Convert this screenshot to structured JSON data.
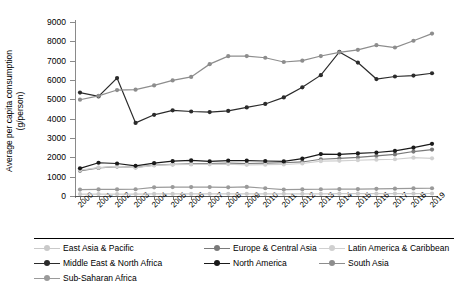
{
  "chart_data": {
    "type": "line",
    "title": "",
    "xlabel": "",
    "ylabel": "Average per capita consumption (g/person)",
    "ylabel_line1": "Average per capita consumption",
    "ylabel_line2": "(g/person)",
    "ylim": [
      0,
      9000
    ],
    "ystep": 1000,
    "yticks": [
      0,
      1000,
      2000,
      3000,
      4000,
      5000,
      6000,
      7000,
      8000,
      9000
    ],
    "grid": false,
    "legend_position": "bottom",
    "categories": [
      "2000",
      "2001",
      "2002",
      "2003",
      "2004",
      "2005",
      "2006",
      "2007",
      "2008",
      "2009",
      "2010",
      "2011",
      "2012",
      "2013",
      "2014",
      "2015",
      "2016",
      "2017",
      "2018",
      "2019"
    ],
    "series": [
      {
        "name": "East Asia & Pacific",
        "color": "#c9c9c9",
        "marker": "circle",
        "values": [
          100,
          100,
          100,
          100,
          105,
          105,
          105,
          110,
          110,
          110,
          110,
          115,
          115,
          115,
          120,
          120,
          120,
          125,
          125,
          130
        ]
      },
      {
        "name": "Europe & Central Asia",
        "color": "#7a7a7a",
        "marker": "circle",
        "values": [
          1300,
          1450,
          1520,
          1480,
          1600,
          1640,
          1660,
          1680,
          1700,
          1680,
          1700,
          1720,
          1760,
          1900,
          1950,
          2000,
          2080,
          2150,
          2300,
          2400
        ]
      },
      {
        "name": "Latin America & Caribbean",
        "color": "#d0d0d0",
        "marker": "circle",
        "values": [
          1340,
          1470,
          1530,
          1470,
          1580,
          1620,
          1630,
          1640,
          1650,
          1610,
          1620,
          1630,
          1680,
          1800,
          1820,
          1850,
          1880,
          1900,
          1980,
          1950
        ]
      },
      {
        "name": "Middle East & North Africa",
        "color": "#2b2b2b",
        "marker": "circle",
        "values": [
          5350,
          5150,
          6100,
          3780,
          4200,
          4430,
          4370,
          4340,
          4400,
          4580,
          4760,
          5100,
          5620,
          6250,
          7450,
          6900,
          6050,
          6180,
          6230,
          6350
        ]
      },
      {
        "name": "North America",
        "color": "#1a1a1a",
        "marker": "circle",
        "values": [
          1430,
          1720,
          1680,
          1560,
          1700,
          1800,
          1840,
          1790,
          1830,
          1830,
          1810,
          1790,
          1930,
          2170,
          2150,
          2200,
          2250,
          2330,
          2500,
          2700
        ]
      },
      {
        "name": "South Asia",
        "color": "#8d8d8d",
        "marker": "circle",
        "values": [
          4980,
          5180,
          5480,
          5500,
          5720,
          5980,
          6160,
          6820,
          7230,
          7240,
          7150,
          6930,
          7000,
          7240,
          7430,
          7560,
          7800,
          7680,
          8030,
          8400
        ]
      },
      {
        "name": "Sub-Saharan Africa",
        "color": "#9a9a9a",
        "marker": "circle",
        "values": [
          330,
          340,
          340,
          350,
          450,
          460,
          460,
          460,
          450,
          470,
          400,
          330,
          340,
          350,
          360,
          360,
          370,
          380,
          390,
          400
        ]
      }
    ],
    "legend_rows": [
      [
        {
          "label": "East Asia & Pacific",
          "color": "#c9c9c9",
          "x": 0
        },
        {
          "label": "Europe & Central Asia",
          "color": "#7a7a7a",
          "x": 170
        },
        {
          "label": "Latin America & Caribbean",
          "color": "#d0d0d0",
          "x": 285
        }
      ],
      [
        {
          "label": "Middle East & North Africa",
          "color": "#2b2b2b",
          "x": 0
        },
        {
          "label": "North America",
          "color": "#1a1a1a",
          "x": 170
        },
        {
          "label": "South Asia",
          "color": "#8d8d8d",
          "x": 285
        }
      ],
      [
        {
          "label": "Sub-Saharan Africa",
          "color": "#9a9a9a",
          "x": 0
        }
      ]
    ]
  }
}
